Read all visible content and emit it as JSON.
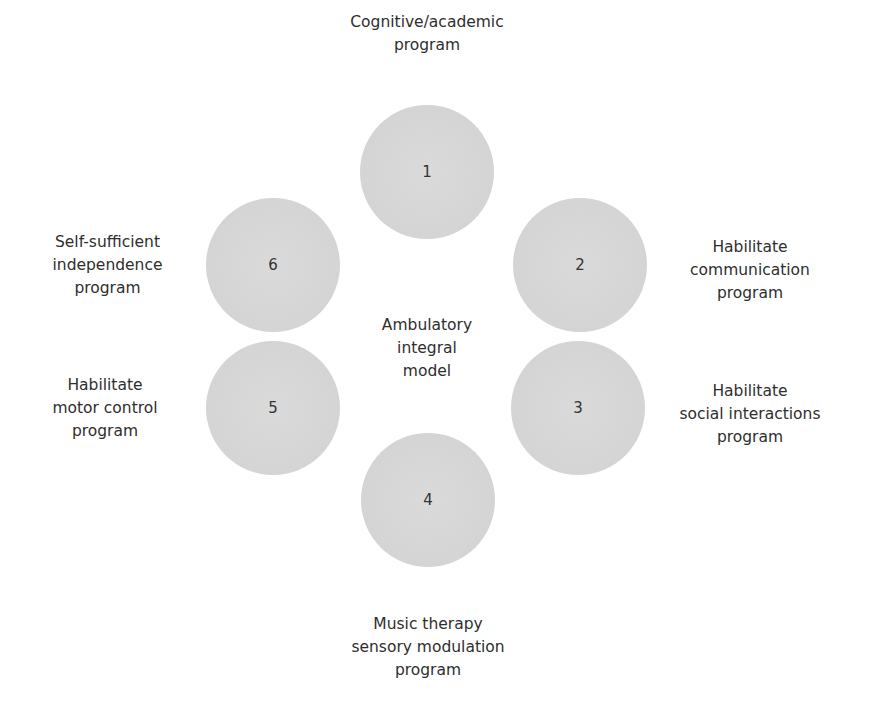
{
  "diagram": {
    "center_label": [
      "Ambulatory",
      "integral",
      "model"
    ],
    "nodes": [
      {
        "number": "1",
        "label": [
          "Cognitive/academic",
          "program"
        ]
      },
      {
        "number": "2",
        "label": [
          "Habilitate",
          "communication",
          "program"
        ]
      },
      {
        "number": "3",
        "label": [
          "Habilitate",
          "social interactions",
          "program"
        ]
      },
      {
        "number": "4",
        "label": [
          "Music therapy",
          "sensory modulation",
          "program"
        ]
      },
      {
        "number": "5",
        "label": [
          "Habilitate",
          "motor control",
          "program"
        ]
      },
      {
        "number": "6",
        "label": [
          "Self-sufficient",
          "independence",
          "program"
        ]
      }
    ],
    "colors": {
      "circle_fill": "#d6d6d6",
      "text": "#2e2e2e",
      "background": "#ffffff"
    }
  }
}
